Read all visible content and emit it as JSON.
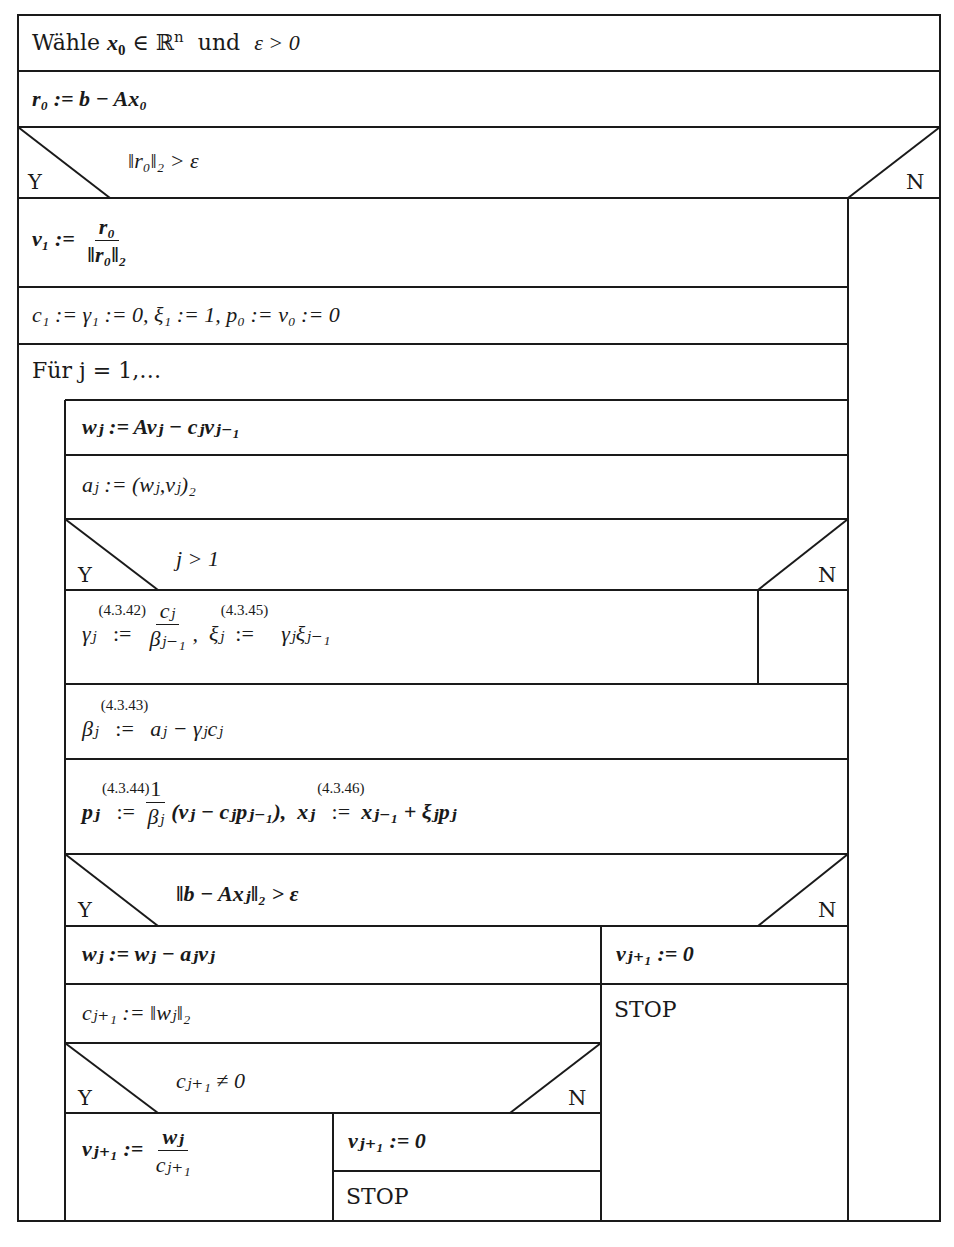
{
  "diagram": {
    "type": "Nassi-Shneiderman structogram",
    "branch_labels": {
      "yes": "Y",
      "no": "N"
    },
    "blocks": {
      "init_choose": {
        "prefix": "Wähle",
        "var": "x",
        "sub": "0",
        "in": " ∈ ℝ",
        "sup": "n",
        "and": "und",
        "eps": "ε > 0"
      },
      "residual": {
        "text": "r₀ := b − Ax₀"
      },
      "cond_outer": {
        "text": "‖r₀‖₂ > ε"
      },
      "v1": {
        "lhs": "v₁ :=",
        "num": "r₀",
        "den": "‖r₀‖₂"
      },
      "init_coeffs": {
        "text": "c₁ := γ₁ := 0,  ξ₁ := 1,  p₀ := v₀ := 0"
      },
      "loop": {
        "text": "Für j = 1,…"
      },
      "w_update": {
        "text": "wⱼ := Avⱼ − cⱼvⱼ₋₁"
      },
      "a_coeff": {
        "text": "aⱼ := (wⱼ,vⱼ)₂"
      },
      "cond_j": {
        "text": "j > 1"
      },
      "gamma_xi": {
        "gamma_lhs": "γⱼ",
        "gamma_ref": "(4.3.42)",
        "assign": ":=",
        "gamma_num": "cⱼ",
        "gamma_den": "βⱼ₋₁",
        "xi_lhs": "ξⱼ",
        "xi_ref": "(4.3.45)",
        "xi_rhs": "γⱼξⱼ₋₁"
      },
      "beta": {
        "lhs": "βⱼ",
        "ref": "(4.3.43)",
        "assign": ":=",
        "rhs": "aⱼ − γⱼcⱼ"
      },
      "p_x": {
        "p_lhs": "pⱼ",
        "p_ref": "(4.3.44)",
        "assign": ":=",
        "p_num": "1",
        "p_den": "βⱼ",
        "p_rhs": "(vⱼ − cⱼpⱼ₋₁),",
        "x_lhs": "xⱼ",
        "x_ref": "(4.3.46)",
        "x_rhs": "xⱼ₋₁ + ξⱼpⱼ"
      },
      "cond_resid": {
        "text": "‖b − Axⱼ‖₂ > ε"
      },
      "w_ortho": {
        "text": "wⱼ := wⱼ − aⱼvⱼ"
      },
      "c_next": {
        "text": "cⱼ₊₁ := ‖wⱼ‖₂"
      },
      "cond_c": {
        "text": "cⱼ₊₁ ≠ 0"
      },
      "v_next": {
        "lhs": "vⱼ₊₁ :=",
        "num": "wⱼ",
        "den": "cⱼ₊₁"
      },
      "v_zero_inner": {
        "text": "vⱼ₊₁ := 0"
      },
      "stop_inner": {
        "text": "STOP"
      },
      "v_zero_outer": {
        "text": "vⱼ₊₁ := 0"
      },
      "stop_outer": {
        "text": "STOP"
      }
    },
    "colors": {
      "line": "#1a1a1a",
      "background": "#ffffff",
      "text": "#1a1a1a"
    }
  }
}
